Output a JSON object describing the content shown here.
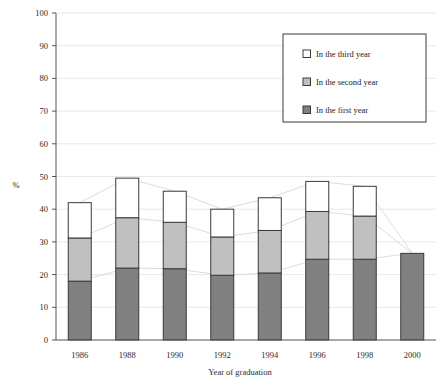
{
  "chart_data": {
    "type": "bar",
    "subtype": "stacked-bar",
    "title": "",
    "xlabel": "Year of graduation",
    "ylabel": "%",
    "ylim": [
      0,
      100
    ],
    "ytick_step": 10,
    "yticks": [
      0,
      10,
      20,
      30,
      40,
      50,
      60,
      70,
      80,
      90,
      100
    ],
    "categories": [
      "1986",
      "1988",
      "1990",
      "1992",
      "1994",
      "1996",
      "1998",
      "2000"
    ],
    "series": [
      {
        "name": "In the first year",
        "color": "#808080",
        "values": [
          18.0,
          22.0,
          21.8,
          19.8,
          20.5,
          24.7,
          24.7,
          26.5
        ]
      },
      {
        "name": "In the second year",
        "color": "#c0c0c0",
        "values": [
          13.2,
          15.4,
          14.2,
          11.7,
          13.0,
          14.6,
          13.2,
          0
        ]
      },
      {
        "name": "In the third year",
        "color": "#ffffff",
        "values": [
          10.8,
          12.1,
          9.5,
          8.5,
          10.0,
          9.2,
          9.1,
          0
        ]
      }
    ],
    "totals": [
      42.0,
      49.5,
      45.5,
      40.0,
      43.5,
      48.5,
      47.0,
      26.5
    ],
    "cumulative_first": [
      18.0,
      22.0,
      21.8,
      19.8,
      20.5,
      24.7,
      24.7,
      26.5
    ],
    "cumulative_second": [
      31.2,
      37.4,
      36.0,
      31.5,
      33.5,
      39.3,
      37.9,
      26.5
    ],
    "grid": true,
    "grid_axis": "y",
    "legend_position": "top-right",
    "connector_lines": true
  },
  "legend": {
    "items": [
      {
        "label": "In the third year",
        "swatch": "white-square-icon"
      },
      {
        "label": "In the second year",
        "swatch": "light-gray-square-icon"
      },
      {
        "label": "In the first year",
        "swatch": "dark-gray-square-icon"
      }
    ]
  },
  "colors": {
    "first_year": "#808080",
    "second_year": "#c0c0c0",
    "third_year": "#ffffff",
    "outline": "#3a3a3a",
    "grid": "#e2e2e2",
    "axis": "#555555",
    "connector": "#d8d8d8"
  }
}
